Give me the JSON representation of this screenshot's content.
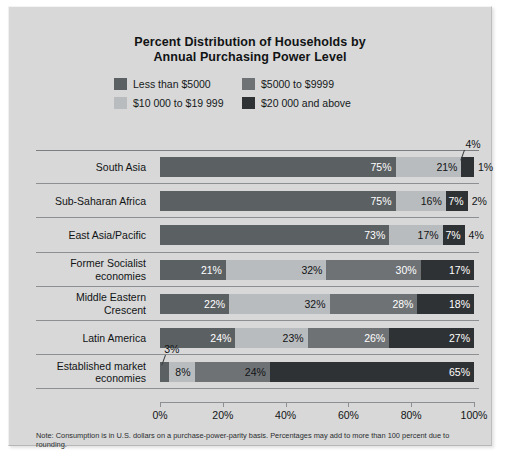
{
  "chart_data": {
    "type": "bar",
    "orientation": "horizontal",
    "stacked": true,
    "title": "Percent Distribution of Households by Annual Purchasing Power Level",
    "title_line1": "Percent Distribution of Households by",
    "title_line2": "Annual Purchasing Power Level",
    "xlabel": "",
    "ylabel": "",
    "xlim": [
      0,
      100
    ],
    "xticks": [
      "0%",
      "20%",
      "40%",
      "60%",
      "80%",
      "100%"
    ],
    "xtick_values": [
      0,
      20,
      40,
      60,
      80,
      100
    ],
    "grid": false,
    "legend_position": "top",
    "categories": [
      "South Asia",
      "Sub-Saharan Africa",
      "East Asia/Pacific",
      "Former Socialist economies",
      "Middle Eastern Crescent",
      "Latin America",
      "Established market economies"
    ],
    "series": [
      {
        "name": "Less than $5000",
        "color": "#5b6063",
        "values": [
          75,
          75,
          73,
          21,
          22,
          24,
          3
        ]
      },
      {
        "name": "$5000 to $9999",
        "color": "#8e9295",
        "values": [
          21,
          16,
          17,
          32,
          32,
          23,
          8
        ]
      },
      {
        "name": "$10 000 to $19 999",
        "color": "#b9bcbe",
        "values": [
          4,
          7,
          7,
          30,
          28,
          26,
          24
        ]
      },
      {
        "name": "$20 000 and above",
        "color": "#2f3234",
        "values": [
          1,
          2,
          4,
          17,
          18,
          27,
          65
        ]
      }
    ],
    "note": "Note: Consumption is in U.S. dollars on a purchase-power-parity basis. Percentages may add to more than 100 percent due to rounding."
  },
  "legend": {
    "items": [
      {
        "label": "Less than $5000",
        "color": "#5b6063"
      },
      {
        "label": "$5000 to $9999",
        "color": "#6e7275"
      },
      {
        "label": "$10 000 to $19 999",
        "color": "#b9bcbe"
      },
      {
        "label": "$20 000 and above",
        "color": "#2f3234"
      }
    ]
  },
  "rows": [
    {
      "category": "South Asia",
      "label_line1": "South Asia",
      "label_line2": "",
      "segments": [
        {
          "value": 75,
          "text": "75%",
          "color": "#5b6063",
          "text_color": "#ffffff",
          "inside": true
        },
        {
          "value": 21,
          "text": "21%",
          "color": "#b9bcbe",
          "text_color": "#111315",
          "inside": true
        },
        {
          "value": 4,
          "text": "",
          "color": "#2f3234",
          "text_color": "#ffffff",
          "inside": true
        }
      ],
      "outside_value": "1%",
      "callout": {
        "text": "4%",
        "target_percent": 96
      }
    },
    {
      "category": "Sub-Saharan Africa",
      "label_line1": "Sub-Saharan Africa",
      "label_line2": "",
      "segments": [
        {
          "value": 75,
          "text": "75%",
          "color": "#5b6063",
          "text_color": "#ffffff",
          "inside": true
        },
        {
          "value": 16,
          "text": "16%",
          "color": "#b9bcbe",
          "text_color": "#111315",
          "inside": true
        },
        {
          "value": 7,
          "text": "7%",
          "color": "#2f3234",
          "text_color": "#ffffff",
          "inside": true
        }
      ],
      "outside_value": "2%",
      "callout": null
    },
    {
      "category": "East Asia/Pacific",
      "label_line1": "East Asia/Pacific",
      "label_line2": "",
      "segments": [
        {
          "value": 73,
          "text": "73%",
          "color": "#5b6063",
          "text_color": "#ffffff",
          "inside": true
        },
        {
          "value": 17,
          "text": "17%",
          "color": "#b9bcbe",
          "text_color": "#111315",
          "inside": true
        },
        {
          "value": 7,
          "text": "7%",
          "color": "#2f3234",
          "text_color": "#ffffff",
          "inside": true
        }
      ],
      "outside_value": "4%",
      "callout": null
    },
    {
      "category": "Former Socialist economies",
      "label_line1": "Former Socialist",
      "label_line2": "economies",
      "segments": [
        {
          "value": 21,
          "text": "21%",
          "color": "#5b6063",
          "text_color": "#ffffff",
          "inside": true
        },
        {
          "value": 32,
          "text": "32%",
          "color": "#b9bcbe",
          "text_color": "#111315",
          "inside": true
        },
        {
          "value": 30,
          "text": "30%",
          "color": "#6e7275",
          "text_color": "#ffffff",
          "inside": true
        },
        {
          "value": 17,
          "text": "17%",
          "color": "#2f3234",
          "text_color": "#ffffff",
          "inside": true
        }
      ],
      "outside_value": "",
      "callout": null
    },
    {
      "category": "Middle Eastern Crescent",
      "label_line1": "Middle Eastern",
      "label_line2": "Crescent",
      "segments": [
        {
          "value": 22,
          "text": "22%",
          "color": "#5b6063",
          "text_color": "#ffffff",
          "inside": true
        },
        {
          "value": 32,
          "text": "32%",
          "color": "#b9bcbe",
          "text_color": "#111315",
          "inside": true
        },
        {
          "value": 28,
          "text": "28%",
          "color": "#6e7275",
          "text_color": "#ffffff",
          "inside": true
        },
        {
          "value": 18,
          "text": "18%",
          "color": "#2f3234",
          "text_color": "#ffffff",
          "inside": true
        }
      ],
      "outside_value": "",
      "callout": null
    },
    {
      "category": "Latin America",
      "label_line1": "Latin America",
      "label_line2": "",
      "segments": [
        {
          "value": 24,
          "text": "24%",
          "color": "#5b6063",
          "text_color": "#ffffff",
          "inside": true
        },
        {
          "value": 23,
          "text": "23%",
          "color": "#b9bcbe",
          "text_color": "#111315",
          "inside": true
        },
        {
          "value": 26,
          "text": "26%",
          "color": "#6e7275",
          "text_color": "#ffffff",
          "inside": true
        },
        {
          "value": 27,
          "text": "27%",
          "color": "#2f3234",
          "text_color": "#ffffff",
          "inside": true
        }
      ],
      "outside_value": "",
      "callout": null
    },
    {
      "category": "Established market economies",
      "label_line1": "Established market",
      "label_line2": "economies",
      "segments": [
        {
          "value": 3,
          "text": "",
          "color": "#5b6063",
          "text_color": "#ffffff",
          "inside": true
        },
        {
          "value": 8,
          "text": "8%",
          "color": "#b9bcbe",
          "text_color": "#111315",
          "inside": true
        },
        {
          "value": 24,
          "text": "24%",
          "color": "#6e7275",
          "text_color": "#111315",
          "inside": true
        },
        {
          "value": 65,
          "text": "65%",
          "color": "#2f3234",
          "text_color": "#ffffff",
          "inside": true
        }
      ],
      "outside_value": "",
      "callout": {
        "text": "3%",
        "target_percent": 1
      }
    }
  ],
  "axis": {
    "ticks": [
      "0%",
      "20%",
      "40%",
      "60%",
      "80%",
      "100%"
    ]
  },
  "note": "Note: Consumption is in U.S. dollars on a purchase-power-parity basis. Percentages may add to more than 100 percent due to rounding."
}
